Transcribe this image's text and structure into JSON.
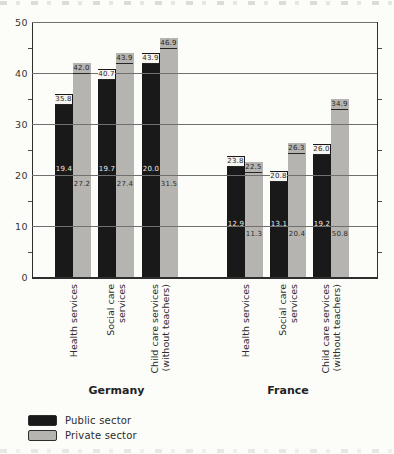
{
  "colors": {
    "public_bar": "#191919",
    "private_bar": "#b5b4b1",
    "grid": "#707070",
    "axis": "#2e2e2e",
    "inner_label_on_public": "#eceae6",
    "inner_label_on_private": "#2b2b2b",
    "top_label_bg_on_public": "#f6f5f1",
    "background": "#fcfcf9"
  },
  "chart_data": {
    "type": "bar",
    "title": "",
    "ylim": [
      0,
      50
    ],
    "yticks": [
      "0",
      "10",
      "20",
      "30",
      "40",
      "50"
    ],
    "ytick_values": [
      0,
      10,
      20,
      30,
      40,
      50
    ],
    "minor_tick_values": [
      5,
      15,
      25,
      35,
      45
    ],
    "grid": true,
    "legend_position": "bottom-left",
    "series_names": [
      "Public sector",
      "Private sector"
    ],
    "groups": [
      {
        "label": "Germany",
        "inner_label_positions": [
          21.2,
          18.3
        ],
        "categories": [
          {
            "label_lines": [
              "Health services"
            ],
            "values": [
              35.8,
              42.0
            ],
            "value_labels": [
              "35.8",
              "42.0"
            ],
            "inner_labels": [
              "19.4",
              "27.2"
            ]
          },
          {
            "label_lines": [
              "Social care",
              "services"
            ],
            "values": [
              40.7,
              43.9
            ],
            "value_labels": [
              "40.7",
              "43.9"
            ],
            "inner_labels": [
              "19.7",
              "27.4"
            ]
          },
          {
            "label_lines": [
              "Child care services",
              "(without teachers)"
            ],
            "values": [
              43.9,
              46.9
            ],
            "value_labels": [
              "43.9",
              "46.9"
            ],
            "inner_labels": [
              "20.0",
              "31.5"
            ]
          }
        ]
      },
      {
        "label": "France",
        "inner_label_positions": [
          10.3,
          8.5
        ],
        "categories": [
          {
            "label_lines": [
              "Health services"
            ],
            "values": [
              23.8,
              22.5
            ],
            "value_labels": [
              "23.8",
              "22.5"
            ],
            "inner_labels": [
              "12.9",
              "11.3"
            ]
          },
          {
            "label_lines": [
              "Social care",
              "services"
            ],
            "values": [
              20.8,
              26.3
            ],
            "value_labels": [
              "20.8",
              "26.3"
            ],
            "inner_labels": [
              "13.1",
              "20.4"
            ]
          },
          {
            "label_lines": [
              "Child care services",
              "(without teachers)"
            ],
            "values": [
              26.0,
              34.9
            ],
            "value_labels": [
              "26.0",
              "34.9"
            ],
            "inner_labels": [
              "19.2",
              "50.8"
            ]
          }
        ]
      }
    ],
    "legend": [
      {
        "label": "Public sector",
        "swatch": "public"
      },
      {
        "label": "Private sector",
        "swatch": "private"
      }
    ]
  }
}
